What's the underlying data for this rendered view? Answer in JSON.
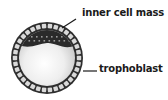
{
  "diagram": {
    "labels": {
      "inner_cell_mass": "inner cell mass",
      "trophoblast": "trophoblast"
    },
    "colors": {
      "ring": "#2e2e2e",
      "cell_fill": "#d9d9d9",
      "inner_cell_mass": "#2a2a2a",
      "cavity_center": "#ffffff",
      "cavity_edge": "#cfcfcf",
      "text": "#1a1a1a"
    }
  }
}
